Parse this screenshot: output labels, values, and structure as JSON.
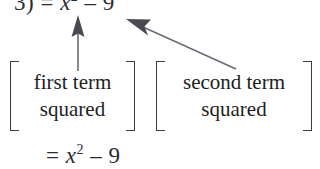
{
  "page": {
    "background_color": "#ffffff",
    "text_color": "#1d1d22",
    "arrow_color": "#5a5a63",
    "bracket_color": "#3d3d45",
    "width": 320,
    "height": 169
  },
  "top_equation": {
    "full_text": "3) = x2 – 9",
    "prefix": "3) = ",
    "variable": "x",
    "exponent": "2",
    "suffix": " – 9",
    "clipped": "true"
  },
  "annotations": {
    "first_label": {
      "line1": "first term",
      "line2": "squared"
    },
    "second_label": {
      "line1": "second term",
      "line2": "squared"
    }
  },
  "arrows": {
    "vertical_arrow": {
      "name": "first-term-arrow",
      "direction": "up",
      "from_x": 78,
      "from_y": 71,
      "to_x": 78,
      "to_y": 17
    },
    "diagonal_arrow": {
      "name": "second-term-arrow",
      "direction": "up-left",
      "from_x": 236,
      "from_y": 69,
      "to_x": 128,
      "to_y": 20
    }
  },
  "result_equation": {
    "full_text": "= x2 – 9",
    "prefix": "= ",
    "variable": "x",
    "exponent": "2",
    "suffix": " – 9"
  }
}
